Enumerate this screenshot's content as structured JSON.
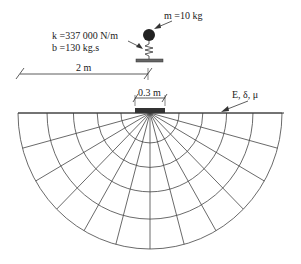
{
  "labels": {
    "mass": "m =10 kg",
    "stiffness": "k =337 000 N/m",
    "damping": "b =130 kg.s",
    "distance": "2 m",
    "footing_width": "0.3 m",
    "soil_props": "E, δ, μ"
  },
  "geometry": {
    "center_x": 150,
    "center_y": 113,
    "rx": 132,
    "ry": 136,
    "arc_fractions": [
      0.22,
      0.4,
      0.58,
      0.78,
      1.0
    ],
    "radial_angles_deg": [
      0,
      15,
      30,
      45,
      60,
      75,
      90,
      105,
      120,
      135,
      150,
      165,
      180
    ]
  },
  "colors": {
    "line": "#444444",
    "ink": "#222222"
  }
}
